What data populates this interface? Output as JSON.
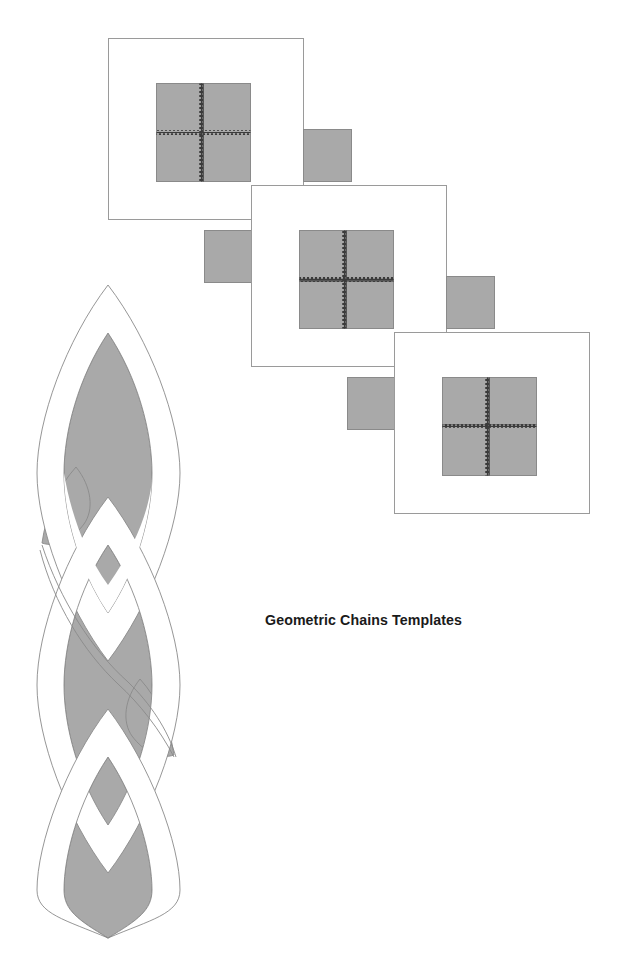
{
  "document": {
    "title": "Geometric Chains Templates",
    "background_color": "#ffffff"
  },
  "palette": {
    "fill_gray": "#a9a9a9",
    "outline_gray": "#8a8a8a",
    "frame_stroke": "#9a9a9a",
    "stitch_dark": "#3b3b3b",
    "text_color": "#1a1a1a"
  },
  "chain_templates": {
    "label": "Square chain link templates",
    "count": 3,
    "units": [
      {
        "name": "link-template-1",
        "frame": {
          "x": 108,
          "y": 38,
          "width": 196,
          "height": 182
        },
        "main_square": {
          "x": 156,
          "y": 83,
          "width": 95,
          "height": 99,
          "stitched": true
        },
        "tab_square": {
          "x": 303,
          "y": 129,
          "width": 49,
          "height": 53
        }
      },
      {
        "name": "link-template-2",
        "frame": {
          "x": 251,
          "y": 185,
          "width": 196,
          "height": 182
        },
        "main_square": {
          "x": 299,
          "y": 230,
          "width": 95,
          "height": 99,
          "stitched": true
        },
        "tab_square": {
          "x": 446,
          "y": 276,
          "width": 49,
          "height": 53
        }
      },
      {
        "name": "link-template-3",
        "frame": {
          "x": 394,
          "y": 332,
          "width": 196,
          "height": 182
        },
        "main_square": {
          "x": 442,
          "y": 377,
          "width": 95,
          "height": 99,
          "stitched": true
        },
        "tab_square": {
          "x": 347,
          "y": 377,
          "width": 49,
          "height": 53
        }
      }
    ],
    "connector_tabs": [
      {
        "name": "connector-tab-1",
        "x": 204,
        "y": 230,
        "width": 49,
        "height": 53
      },
      {
        "name": "connector-tab-2",
        "x": 347,
        "y": 377,
        "width": 49,
        "height": 53
      }
    ],
    "stitch_pattern": "zigzag-cross"
  },
  "braided_chain": {
    "label": "Braided interlace chain template",
    "bounds": {
      "x": 37,
      "y": 285,
      "width": 143,
      "height": 653
    },
    "lobe_count": 3,
    "side_lobe_count": 2,
    "center_x": 108,
    "top_tip_y": 285,
    "bottom_tip_y": 938,
    "description": "Two interlaced ribbons forming pointed-oval vesica shapes with alternating over-under crossings"
  }
}
